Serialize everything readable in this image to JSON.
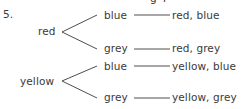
{
  "problem_number": "5.",
  "clipped_top_fragment": "g  4",
  "tree": {
    "branches": [
      {
        "label": "red",
        "children": [
          {
            "label": "blue",
            "outcome": "red, blue"
          },
          {
            "label": "grey",
            "outcome": "red, grey"
          }
        ]
      },
      {
        "label": "yellow",
        "children": [
          {
            "label": "blue",
            "outcome": "yellow, blue"
          },
          {
            "label": "grey",
            "outcome": "yellow, grey"
          }
        ]
      }
    ]
  },
  "colors": {
    "text": "#3a3a3a",
    "lines": "#3a3a3a",
    "background": "#ffffff"
  }
}
